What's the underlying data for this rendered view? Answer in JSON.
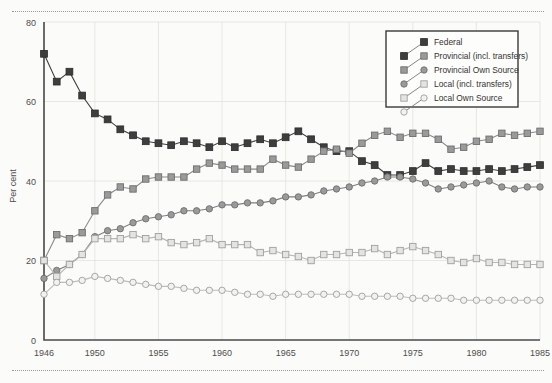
{
  "chart_data": {
    "type": "line",
    "title": "",
    "xlabel": "",
    "ylabel": "Per cent",
    "ylim": [
      0,
      80
    ],
    "yticks": [
      0,
      20,
      40,
      60,
      80
    ],
    "xlim": [
      1946,
      1985
    ],
    "xticks": [
      1946,
      1950,
      1955,
      1960,
      1965,
      1970,
      1975,
      1980,
      1985
    ],
    "xticklabels": [
      "1946",
      "1950",
      "1955",
      "1960",
      "1965",
      "1970",
      "1975",
      "1980",
      "1985"
    ],
    "yticklabels": [
      "0",
      "20",
      "40",
      "60",
      "80"
    ],
    "grid": true,
    "legend_position": "top-right",
    "x": [
      1946,
      1947,
      1948,
      1949,
      1950,
      1951,
      1952,
      1953,
      1954,
      1955,
      1956,
      1957,
      1958,
      1959,
      1960,
      1961,
      1962,
      1963,
      1964,
      1965,
      1966,
      1967,
      1968,
      1969,
      1970,
      1971,
      1972,
      1973,
      1974,
      1975,
      1976,
      1977,
      1978,
      1979,
      1980,
      1981,
      1982,
      1983,
      1984,
      1985
    ],
    "series": [
      {
        "name": "Federal",
        "marker": "filled-square",
        "color": "#3e3e3e",
        "values": [
          72.0,
          65.0,
          67.5,
          61.5,
          57.0,
          55.5,
          53.0,
          51.5,
          50.0,
          49.5,
          49.0,
          50.0,
          49.5,
          48.5,
          50.0,
          48.5,
          49.5,
          50.5,
          49.5,
          51.0,
          52.5,
          50.5,
          48.5,
          47.5,
          47.5,
          45.0,
          44.0,
          41.5,
          41.5,
          42.5,
          44.5,
          42.5,
          43.0,
          42.5,
          42.5,
          43.0,
          42.5,
          43.0,
          43.5,
          44.0
        ]
      },
      {
        "name": "Provincial (incl. transfers)",
        "marker": "shaded-square",
        "color": "#8a8a8a",
        "values": [
          20.0,
          26.5,
          25.5,
          27.0,
          32.5,
          36.5,
          38.5,
          38.0,
          40.5,
          41.0,
          41.0,
          41.0,
          43.0,
          44.5,
          44.0,
          43.0,
          43.0,
          43.0,
          45.5,
          44.0,
          43.5,
          45.5,
          47.5,
          48.0,
          47.0,
          49.5,
          51.5,
          52.5,
          51.0,
          52.0,
          52.0,
          50.5,
          48.0,
          48.5,
          50.0,
          50.5,
          52.0,
          51.5,
          52.0,
          52.5
        ]
      },
      {
        "name": "Provincial Own Source",
        "marker": "shaded-circle",
        "color": "#7f7f7f",
        "values": [
          15.5,
          17.5,
          19.0,
          21.5,
          26.0,
          27.5,
          28.0,
          29.5,
          30.5,
          31.0,
          31.5,
          32.5,
          32.5,
          33.0,
          34.0,
          34.0,
          34.5,
          34.5,
          35.0,
          36.0,
          36.0,
          36.5,
          37.5,
          38.0,
          38.5,
          39.5,
          40.0,
          41.0,
          41.0,
          40.5,
          39.5,
          38.0,
          38.5,
          39.0,
          39.5,
          40.0,
          38.5,
          38.0,
          38.5,
          38.5
        ]
      },
      {
        "name": "Local (incl. transfers)",
        "marker": "light-square",
        "color": "#b6b6b6",
        "values": [
          20.0,
          16.0,
          19.0,
          21.5,
          25.5,
          25.5,
          25.5,
          26.5,
          25.5,
          26.0,
          24.5,
          24.0,
          24.5,
          25.5,
          24.0,
          24.0,
          24.0,
          22.0,
          22.5,
          21.5,
          21.0,
          20.0,
          21.5,
          21.5,
          22.0,
          22.0,
          23.0,
          21.5,
          22.5,
          23.5,
          22.5,
          21.5,
          20.0,
          19.5,
          20.5,
          19.5,
          19.5,
          19.0,
          19.0,
          19.0
        ]
      },
      {
        "name": "Local Own Source",
        "marker": "light-circle",
        "color": "#bdbdbd",
        "values": [
          11.5,
          14.5,
          14.5,
          15.0,
          16.0,
          15.5,
          15.0,
          14.5,
          14.0,
          13.5,
          13.5,
          13.0,
          12.5,
          12.5,
          12.5,
          12.0,
          11.5,
          11.5,
          11.0,
          11.5,
          11.5,
          11.5,
          11.5,
          11.5,
          11.5,
          11.0,
          11.0,
          11.0,
          11.0,
          10.5,
          10.5,
          10.5,
          10.5,
          10.0,
          10.0,
          10.0,
          10.0,
          10.0,
          10.0,
          10.0
        ]
      }
    ]
  },
  "legend": {
    "items": [
      {
        "label": "Federal"
      },
      {
        "label": "Provincial (incl. transfers)"
      },
      {
        "label": "Provincial Own Source"
      },
      {
        "label": "Local (incl. transfers)"
      },
      {
        "label": "Local Own Source"
      }
    ]
  }
}
